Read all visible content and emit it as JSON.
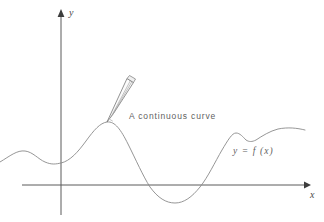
{
  "figure": {
    "background_color": "#ffffff",
    "width": 324,
    "height": 222,
    "curve_color": "#8a8a8a",
    "axis_color": "#5a5a5a",
    "text_color": "#5f5f5f"
  },
  "axes": {
    "y_label": "y",
    "x_label": "x",
    "origin": {
      "x": 61,
      "y": 185
    },
    "y_axis_top": 10,
    "y_axis_bottom": 215,
    "x_axis_left": 22,
    "x_axis_right": 308,
    "y_arrow_name": "y-axis-arrowhead",
    "x_arrow_name": "x-axis-arrowhead"
  },
  "annotations": {
    "caption": "A continuous curve",
    "function_label": "y = f (x)"
  },
  "pencil": {
    "name": "pencil-icon",
    "tip": {
      "x": 107,
      "y": 122
    },
    "cap": {
      "x": 130,
      "y": 78
    },
    "tilt_degrees": 28
  },
  "chart_data": {
    "type": "line",
    "title": "A continuous curve",
    "xlabel": "x",
    "ylabel": "y",
    "grid": false,
    "legend": null,
    "series": [
      {
        "name": "y = f (x)",
        "description": "A smooth continuous curve with a small left bump, a local minimum at the y-axis, a tall local maximum where the pencil tip touches, a broad trough dipping below the x-axis, then a peak, a shallow notch and a final rise.",
        "path": "M 0 162 C 10 156 17 150 25 151 C 33 152 38 159 45 162 C 52 165 56 164 61 163 C 70 161 78 152 86 141 C 94 130 100 123 107 122 C 115 121 121 130 128 144 C 136 160 143 176 150 187 C 158 198 166 203 175 203 C 184 203 192 197 200 187 C 208 177 215 162 222 150 C 228 140 232 133 236 133 C 240 133 243 137 246 140 C 249 142 252 142 256 140 C 262 136 270 131 278 129 C 288 127 297 128 305 130",
        "key_points": [
          {
            "label": "start",
            "x": 0,
            "y": 162
          },
          {
            "label": "left-bump-max",
            "x": 25,
            "y": 151
          },
          {
            "label": "local-min-at-y-axis",
            "x": 61,
            "y": 163
          },
          {
            "label": "local-max-pencil-tip",
            "x": 107,
            "y": 122
          },
          {
            "label": "x-axis-crossing-down",
            "x": 148,
            "y": 185
          },
          {
            "label": "trough-min",
            "x": 175,
            "y": 203
          },
          {
            "label": "x-axis-crossing-up",
            "x": 205,
            "y": 185
          },
          {
            "label": "right-peak",
            "x": 236,
            "y": 133
          },
          {
            "label": "notch-min",
            "x": 248,
            "y": 141
          },
          {
            "label": "end",
            "x": 305,
            "y": 130
          }
        ]
      }
    ]
  }
}
